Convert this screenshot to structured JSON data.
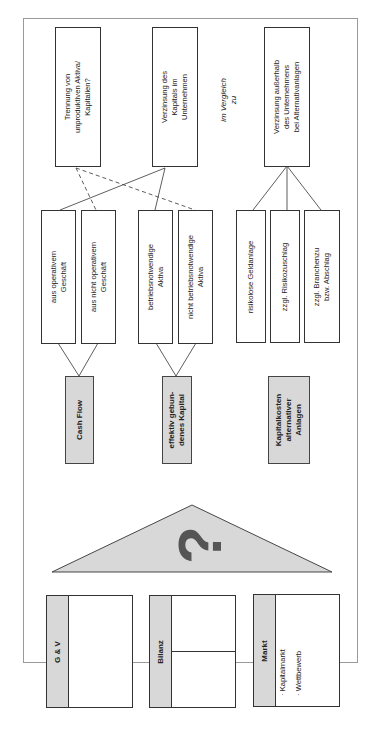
{
  "top_boxes": {
    "trennung": "Trennung von\nunproduktiven Aktiva/\nKapitalien?",
    "verzinsung_intern": "Verzinsung des\nKapitals im\nUnternehmen",
    "vergleich": "im Vergleich\nzu",
    "verzinsung_extern": "Verzinsung außerhalb\ndes Unternehmens\nbei Alternativanlagen"
  },
  "middle_boxes": {
    "aus_operativem": "aus operativem\nGeschäft",
    "aus_nicht_operativem": "aus nicht operativem\nGeschäft",
    "betriebsnotwendige": "betriebsnotwendige\nAktiva",
    "nicht_betriebsnotwendige": "nicht betriebsnotwendige\nAktiva",
    "risikolose": "risikolose Geldanlage",
    "risikozuschlag": "zzgl. Risikozuschlag",
    "branchenzu": "zzgl. Branchenzu\nbzw. Abschlag"
  },
  "gray_boxes": {
    "cash_flow": "Cash Flow",
    "kapital": "effektiv gebun-\ndenes Kapital",
    "kapitalkosten": "Kapitalkosten\nalternativer\nAnlagen"
  },
  "pediment": {
    "symbol": "?"
  },
  "foundation": {
    "guv": {
      "title": "G & V"
    },
    "bilanz": {
      "title": "Bilanz"
    },
    "markt": {
      "title": "Markt",
      "items": [
        "· Kapitalmarkt",
        "· Wettbewerb"
      ]
    }
  },
  "colors": {
    "gray_fill": "#d8d8d8",
    "line": "#333333",
    "frame": "#9a9a9a",
    "symbol": "#555555"
  }
}
